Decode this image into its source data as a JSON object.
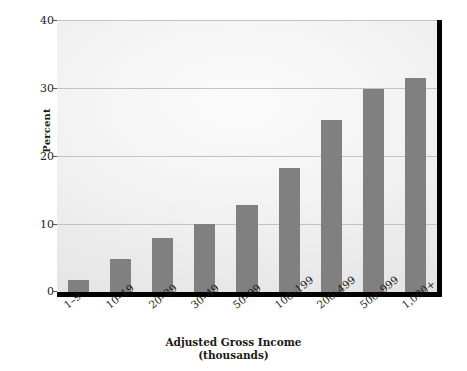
{
  "chart_data": {
    "type": "bar",
    "title": "",
    "subtitle": "",
    "xlabel": "Adjusted Gross Income",
    "xlabel_sub": "(thousands)",
    "ylabel": "Percent",
    "categories": [
      "1–9",
      "10–19",
      "20–29",
      "30–49",
      "50–99",
      "100–199",
      "200–499",
      "500–999",
      "1,000+"
    ],
    "values": [
      1.8,
      4.9,
      8.0,
      10.0,
      12.8,
      18.3,
      25.3,
      29.8,
      31.5
    ],
    "ylim": [
      0,
      40
    ],
    "yticks": [
      0,
      10,
      20,
      30,
      40
    ],
    "ytick_labels": [
      "0",
      "10",
      "20",
      "30",
      "40"
    ],
    "grid": true,
    "grid_axis": "y",
    "legend": false,
    "legend_position": "none",
    "bar_color": "#808080",
    "plot_background": "#ededed",
    "axis_color": "#000000",
    "gridline_color": "#c2c2c2"
  }
}
